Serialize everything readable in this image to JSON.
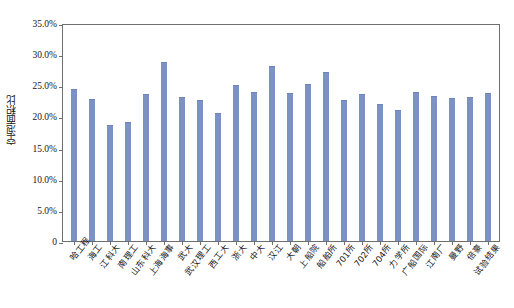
{
  "chart_data": {
    "type": "bar",
    "title": "",
    "xlabel": "",
    "ylabel": "空泡面积比",
    "ylim": [
      0,
      35
    ],
    "ytick_labels": [
      "0",
      "5.0%",
      "10.0%",
      "15.0%",
      "20.0%",
      "25.0%",
      "30.0%",
      "35.0%"
    ],
    "ytick_values": [
      0,
      5,
      10,
      15,
      20,
      25,
      30,
      35
    ],
    "grid": false,
    "legend": false,
    "bar_color": "#7d92c4",
    "categories": [
      "哈工程",
      "海工",
      "江科大",
      "南理工",
      "山东科大",
      "上海海事",
      "武大",
      "武汉理工",
      "西工大",
      "浙大",
      "中大",
      "汉江",
      "大朝",
      "上船院",
      "船舶所",
      "701所",
      "702所",
      "704所",
      "力学所",
      "广船国际",
      "江南厂",
      "曼野",
      "倍豪",
      "试验结果"
    ],
    "values": [
      24.4,
      22.8,
      18.7,
      19.1,
      23.6,
      28.7,
      23.1,
      22.7,
      20.6,
      25.1,
      23.9,
      28.1,
      23.7,
      25.2,
      27.2,
      22.6,
      23.6,
      22.0,
      21.1,
      23.9,
      23.3,
      22.9,
      23.1,
      23.8
    ]
  }
}
